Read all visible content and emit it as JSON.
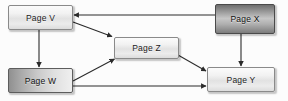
{
  "diagram": {
    "background_color": "#fcfcfc",
    "edge_color": "#2b2b2b",
    "nodes": [
      {
        "id": "V",
        "label": "Page V",
        "style": "light",
        "fill_color": "#ececec",
        "border_color": "#8a8a8a",
        "x": 8,
        "y": 5,
        "w": 65,
        "h": 25
      },
      {
        "id": "X",
        "label": "Page X",
        "style": "dark-vert",
        "fill_color": "#9a9a9a",
        "border_color": "#4a4a4a",
        "x": 215,
        "y": 4,
        "w": 60,
        "h": 30
      },
      {
        "id": "Z",
        "label": "Page Z",
        "style": "light",
        "fill_color": "#e8e8e8",
        "border_color": "#8a8a8a",
        "x": 114,
        "y": 37,
        "w": 65,
        "h": 22
      },
      {
        "id": "W",
        "label": "Page W",
        "style": "dark-horiz",
        "fill_color": "#b4b4b4",
        "border_color": "#5d5d5d",
        "x": 8,
        "y": 68,
        "w": 65,
        "h": 25
      },
      {
        "id": "Y",
        "label": "Page Y",
        "style": "light",
        "fill_color": "#ececec",
        "border_color": "#8a8a8a",
        "x": 207,
        "y": 67,
        "w": 68,
        "h": 25
      }
    ],
    "edges": [
      {
        "id": "x-to-v",
        "from": "X",
        "to": "V",
        "kind": "horizontal",
        "x1": 215,
        "y1": 15,
        "x2": 74,
        "y2": 15
      },
      {
        "id": "v-to-z",
        "from": "V",
        "to": "Z",
        "kind": "diagonal",
        "x1": 73,
        "y1": 22,
        "x2": 113,
        "y2": 37
      },
      {
        "id": "v-to-w",
        "from": "V",
        "to": "W",
        "kind": "vertical",
        "x1": 39,
        "y1": 30,
        "x2": 39,
        "y2": 67
      },
      {
        "id": "w-to-z",
        "from": "W",
        "to": "Z",
        "kind": "diagonal",
        "x1": 73,
        "y1": 81,
        "x2": 115,
        "y2": 59
      },
      {
        "id": "z-to-y",
        "from": "Z",
        "to": "Y",
        "kind": "diagonal",
        "x1": 178,
        "y1": 55,
        "x2": 206,
        "y2": 71
      },
      {
        "id": "w-to-y",
        "from": "W",
        "to": "Y",
        "kind": "horizontal",
        "x1": 73,
        "y1": 86,
        "x2": 206,
        "y2": 86
      },
      {
        "id": "x-to-y",
        "from": "X",
        "to": "Y",
        "kind": "vertical",
        "x1": 241,
        "y1": 34,
        "x2": 241,
        "y2": 66
      }
    ]
  }
}
